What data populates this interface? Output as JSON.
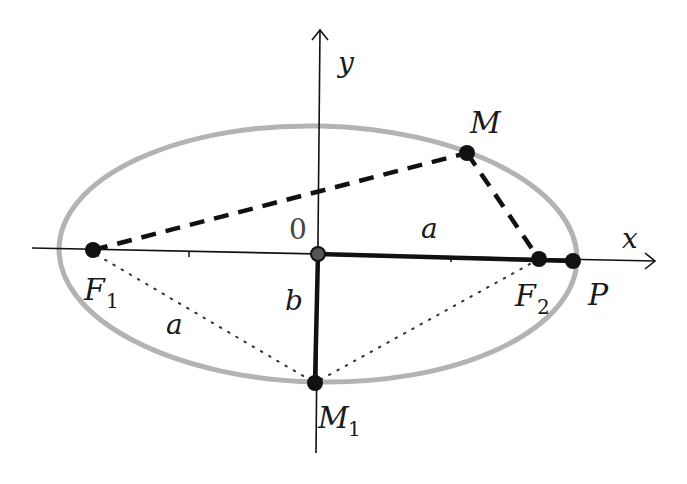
{
  "diagram": {
    "colors": {
      "ellipse": "#b3b3b3",
      "ink": "#111111",
      "origin_fill": "#555555"
    },
    "axes": {
      "x_label": "x",
      "y_label": "y",
      "origin_label": "0"
    },
    "points": {
      "F1": {
        "label": "F",
        "sub": "1"
      },
      "F2": {
        "label": "F",
        "sub": "2"
      },
      "M": {
        "label": "M"
      },
      "M1": {
        "label": "M",
        "sub": "1"
      },
      "P": {
        "label": "P"
      }
    },
    "segment_labels": {
      "semi_major_top": "a",
      "focal_radius_left": "a",
      "semi_minor": "b"
    }
  }
}
